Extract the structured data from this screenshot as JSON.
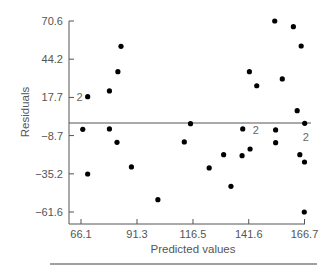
{
  "chart_data": {
    "type": "scatter",
    "title": "",
    "xlabel": "Predicted values",
    "ylabel": "Residuals",
    "x_ticks": [
      66.1,
      91.3,
      116.5,
      141.6,
      166.7
    ],
    "x_tick_labels": [
      "66.1",
      "91.3",
      "116.5",
      "141.6",
      "166.7"
    ],
    "y_ticks": [
      70.6,
      44.2,
      17.7,
      -8.7,
      -35.2,
      -61.6
    ],
    "y_tick_labels": [
      "70.6",
      "44.2",
      "17.7",
      "−8.7",
      "−35.2",
      "−61.6"
    ],
    "xlim": [
      66.1,
      166.7
    ],
    "ylim": [
      -61.6,
      70.6
    ],
    "reference_line": {
      "y": 0,
      "style": "solid horizontal"
    },
    "grid": false,
    "legend": null,
    "annotations": [
      "'2' marks points representing two coincident observations"
    ],
    "points": [
      {
        "x": 69.1,
        "y": 18.2,
        "count": 2
      },
      {
        "x": 66.9,
        "y": -4.4,
        "count": 1
      },
      {
        "x": 69.1,
        "y": -35.3,
        "count": 1
      },
      {
        "x": 78.9,
        "y": 22.2,
        "count": 1
      },
      {
        "x": 78.9,
        "y": -4.1,
        "count": 1
      },
      {
        "x": 82.7,
        "y": 35.5,
        "count": 1
      },
      {
        "x": 84.1,
        "y": 53.1,
        "count": 1
      },
      {
        "x": 82.3,
        "y": -13.4,
        "count": 1
      },
      {
        "x": 88.8,
        "y": -30.4,
        "count": 1
      },
      {
        "x": 100.7,
        "y": -53.1,
        "count": 1
      },
      {
        "x": 112.6,
        "y": -13.1,
        "count": 1
      },
      {
        "x": 115.4,
        "y": -0.5,
        "count": 1
      },
      {
        "x": 123.8,
        "y": -31.1,
        "count": 1
      },
      {
        "x": 130.3,
        "y": -21.9,
        "count": 1
      },
      {
        "x": 133.6,
        "y": -43.8,
        "count": 1
      },
      {
        "x": 138.6,
        "y": -22.6,
        "count": 1
      },
      {
        "x": 138.9,
        "y": -4.1,
        "count": 2
      },
      {
        "x": 141.9,
        "y": 35.5,
        "count": 1
      },
      {
        "x": 142.2,
        "y": -18.0,
        "count": 1
      },
      {
        "x": 145.2,
        "y": 25.8,
        "count": 1
      },
      {
        "x": 153.3,
        "y": 70.6,
        "count": 1
      },
      {
        "x": 153.7,
        "y": -4.8,
        "count": 1
      },
      {
        "x": 153.7,
        "y": -13.6,
        "count": 1
      },
      {
        "x": 156.7,
        "y": 30.5,
        "count": 1
      },
      {
        "x": 161.7,
        "y": 66.7,
        "count": 1
      },
      {
        "x": 163.4,
        "y": 8.5,
        "count": 1
      },
      {
        "x": 164.6,
        "y": -21.9,
        "count": 1
      },
      {
        "x": 165.2,
        "y": 53.3,
        "count": 1
      },
      {
        "x": 166.6,
        "y": -61.6,
        "count": 1
      },
      {
        "x": 166.7,
        "y": -27.0,
        "count": 1
      },
      {
        "x": 166.8,
        "y": -0.2,
        "count": 2
      }
    ]
  },
  "colors": {
    "axis": "#555555",
    "point": "#000000",
    "text": "#555555",
    "reference_line": "#555555",
    "rule": "#444444"
  }
}
